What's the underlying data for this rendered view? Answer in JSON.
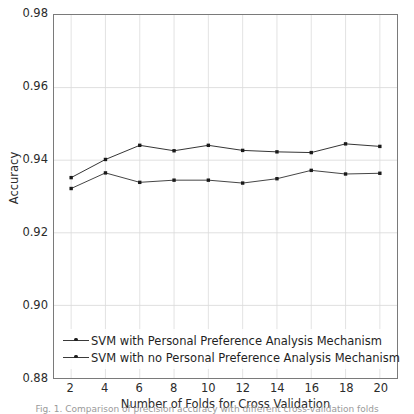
{
  "chart_data": {
    "type": "line",
    "title": "",
    "xlabel": "Number of Folds for Cross Validation",
    "ylabel": "Accuracy",
    "x": [
      2,
      4,
      6,
      8,
      10,
      12,
      14,
      16,
      18,
      20
    ],
    "xlim": [
      1,
      21
    ],
    "ylim": [
      0.88,
      0.98
    ],
    "xticks": [
      "2",
      "4",
      "6",
      "8",
      "10",
      "12",
      "14",
      "16",
      "18",
      "20"
    ],
    "yticks": [
      "0.88",
      "0.90",
      "0.92",
      "0.94",
      "0.96",
      "0.98"
    ],
    "ytick_values": [
      0.88,
      0.9,
      0.92,
      0.94,
      0.96,
      0.98
    ],
    "grid": true,
    "legend_position": "lower left",
    "series": [
      {
        "name": "SVM with Personal Preference Analysis Mechanism",
        "color": "#333333",
        "marker": "dot",
        "values": [
          0.9352,
          0.9402,
          0.9441,
          0.9426,
          0.9441,
          0.9427,
          0.9423,
          0.9421,
          0.9445,
          0.9438
        ]
      },
      {
        "name": "SVM with no Personal Preference Analysis Mechanism",
        "color": "#444444",
        "marker": "dot",
        "values": [
          0.9322,
          0.9365,
          0.9339,
          0.9345,
          0.9345,
          0.9337,
          0.9349,
          0.9372,
          0.9362,
          0.9364
        ]
      }
    ]
  },
  "caption": {
    "text": "Fig. 1. Comparison of precision accuracy with different cross-validation folds"
  }
}
